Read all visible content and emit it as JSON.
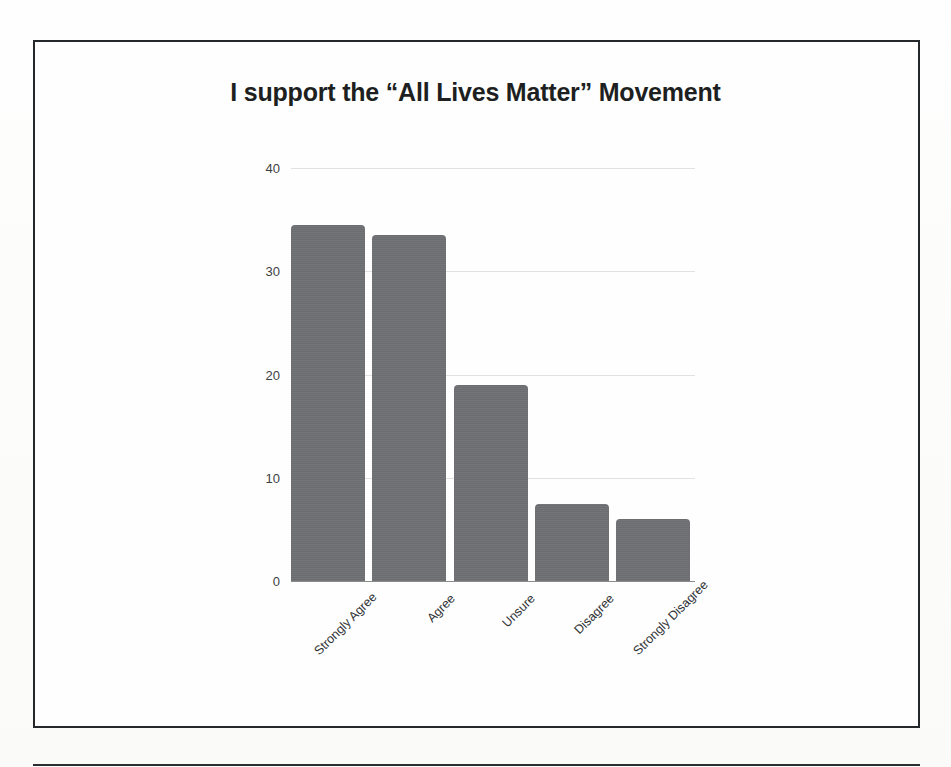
{
  "slide": {
    "title": "I support the “All Lives Matter” Movement"
  },
  "chart_data": {
    "type": "bar",
    "title": "I support the “All Lives Matter” Movement",
    "xlabel": "",
    "ylabel": "",
    "categories": [
      "Strongly Agree",
      "Agree",
      "Unsure",
      "Disagree",
      "Strongly Disagree"
    ],
    "values": [
      34.5,
      33.5,
      19,
      7.5,
      6
    ],
    "ylim": [
      0,
      40
    ],
    "yticks": [
      0,
      10,
      20,
      30,
      40
    ],
    "ytick_labels": [
      "0",
      "10",
      "20",
      "30",
      "40"
    ],
    "grid": true,
    "legend": false,
    "bar_color": "#6e7073",
    "gridline_color": "#e3e1e0",
    "axis_color": "#8b8b8b",
    "title_color": "#1d1f21"
  }
}
